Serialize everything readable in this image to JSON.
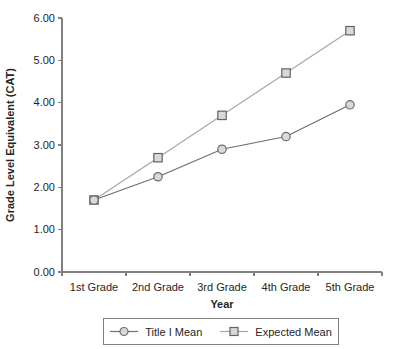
{
  "chart_data": {
    "type": "line",
    "title": "",
    "categories": [
      "1st Grade",
      "2nd Grade",
      "3rd Grade",
      "4th Grade",
      "5th Grade"
    ],
    "series": [
      {
        "name": "Title I Mean",
        "marker": "circle",
        "values": [
          1.7,
          2.25,
          2.9,
          3.2,
          3.95
        ],
        "line_color": "#6d6d6d",
        "marker_fill": "#d9d9d9",
        "marker_stroke": "#6d6d6d"
      },
      {
        "name": "Expected Mean",
        "marker": "square",
        "values": [
          1.7,
          2.7,
          3.7,
          4.7,
          5.7
        ],
        "line_color": "#a6a6a6",
        "marker_fill": "#d9d9d9",
        "marker_stroke": "#636363"
      }
    ],
    "xlabel": "Year",
    "ylabel": "Grade Level Equivalent (CAT)",
    "ylim": [
      0,
      6
    ],
    "ytick_labels": [
      "0.00",
      "1.00",
      "2.00",
      "3.00",
      "4.00",
      "5.00",
      "6.00"
    ],
    "grid": false,
    "legend_position": "bottom",
    "axis_color": "#808080",
    "text_color": "#262626"
  }
}
